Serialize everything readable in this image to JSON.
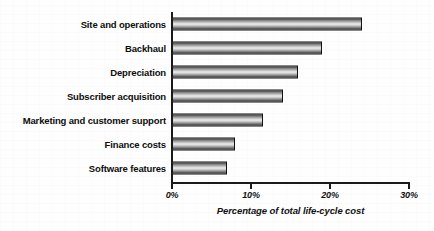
{
  "chart_data": {
    "type": "bar",
    "orientation": "horizontal",
    "title": "",
    "xlabel": "Percentage of total life-cycle cost",
    "ylabel": "",
    "categories": [
      "Site and operations",
      "Backhaul",
      "Depreciation",
      "Subscriber acquisition",
      "Marketing and customer support",
      "Finance costs",
      "Software features"
    ],
    "values": [
      24,
      19,
      16,
      14,
      11.5,
      8,
      7
    ],
    "value_labels": [
      "24%",
      "19%",
      "16%",
      "14%",
      "11.5%",
      "8%",
      "7%"
    ],
    "xlim": [
      0,
      30
    ],
    "xticks": [
      0,
      10,
      20,
      30
    ],
    "xtick_labels": [
      "0%",
      "10%",
      "20%",
      "30%"
    ],
    "grid": false,
    "legend": false,
    "legend_position": "none",
    "bar_fill": "horizontal-gradient-stripe",
    "bar_edge_color": "#111111",
    "axis_color": "#1a1a1a",
    "background_color": "#ffffff"
  },
  "axis": {
    "caption": "Percentage of total life-cycle cost"
  }
}
